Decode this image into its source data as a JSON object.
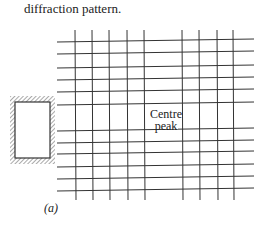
{
  "caption": "diffraction pattern.",
  "centre_label_line1": "Centre",
  "centre_label_line2": "peak",
  "subfigure_label": "(a)",
  "grid": {
    "horizontal_y": [
      41,
      53,
      67,
      79,
      91,
      104,
      130,
      142,
      153,
      166,
      178,
      190
    ],
    "vertical_x": [
      75,
      92,
      109,
      127,
      144,
      182,
      199,
      217,
      233
    ]
  }
}
